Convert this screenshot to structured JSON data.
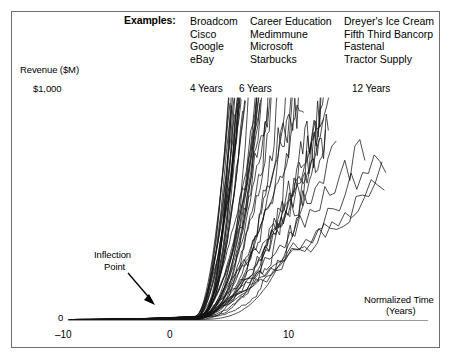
{
  "figure": {
    "examples_label": "Examples:",
    "example_columns": [
      [
        "Broadcom",
        "Cisco",
        "Google",
        "eBay"
      ],
      [
        "Career Education",
        "Medimmune",
        "Microsoft",
        "Starbucks"
      ],
      [
        "Dreyer's Ice Cream",
        "Fifth Third Bancorp",
        "Fastenal",
        "Tractor Supply"
      ]
    ],
    "milestones": [
      {
        "label": "4 Years"
      },
      {
        "label": "6 Years"
      },
      {
        "label": "12 Years"
      }
    ],
    "annotation": {
      "line1": "Inflection",
      "line2": "Point"
    },
    "colors": {
      "frame": "#6e6e6e",
      "curve": "#111111",
      "axis": "#8c8c8c",
      "text": "#000000"
    }
  },
  "chart_data": {
    "type": "line",
    "title": "",
    "subtitle": "",
    "xlabel": "Normalized Time",
    "xlabel_units": "(Years)",
    "ylabel": "Revenue ($M)",
    "xlim": [
      -12,
      22
    ],
    "ylim": [
      0,
      1000
    ],
    "xticks": [
      -10,
      0,
      10
    ],
    "xticklabels": [
      "–10",
      "0",
      "10"
    ],
    "yticks": [
      0,
      1000
    ],
    "yticklabels": [
      "0",
      "$1,000"
    ],
    "grid": false,
    "legend": "none",
    "annotations": [
      {
        "text": "Inflection Point",
        "x": -4.5,
        "y": 60,
        "arrow_to_x": -0.5,
        "arrow_to_y": 8
      },
      {
        "text": "4 Years",
        "x": 1.2,
        "y": 980
      },
      {
        "text": "6 Years",
        "x": 4.0,
        "y": 980
      },
      {
        "text": "12 Years",
        "x": 14.5,
        "y": 980
      }
    ],
    "series_description": "Many overlapping company revenue trajectories, flat near zero before the inflection point at time 0, then growing steeply to $1,000M over 4 to 12 years.",
    "series_count": 48
  }
}
